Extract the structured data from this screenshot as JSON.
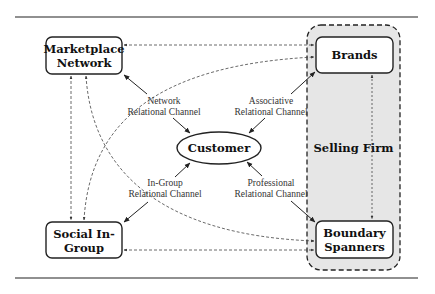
{
  "diagram": {
    "nodes": {
      "marketplace_network": {
        "line1": "Marketplace",
        "line2": "Network"
      },
      "social_in_group": {
        "line1": "Social In-",
        "line2": "Group"
      },
      "brands": {
        "label": "Brands"
      },
      "boundary_spanners": {
        "line1": "Boundary",
        "line2": "Spanners"
      },
      "customer": {
        "label": "Customer"
      }
    },
    "groups": {
      "selling_firm": {
        "label": "Selling Firm",
        "fill": "#e6e6e6"
      }
    },
    "edge_labels": {
      "network": {
        "line1": "Network",
        "line2": "Relational Channel"
      },
      "associative": {
        "line1": "Associative",
        "line2": "Relational Channel"
      },
      "in_group": {
        "line1": "In-Group",
        "line2": "Relational Channel"
      },
      "professional": {
        "line1": "Professional",
        "line2": "Relational Channel"
      }
    },
    "edges": [
      {
        "from": "Marketplace Network",
        "to": "Customer",
        "style": "solid",
        "label": "Network Relational Channel"
      },
      {
        "from": "Brands",
        "to": "Customer",
        "style": "solid",
        "label": "Associative Relational Channel"
      },
      {
        "from": "Social In-Group",
        "to": "Customer",
        "style": "solid",
        "label": "In-Group Relational Channel"
      },
      {
        "from": "Boundary Spanners",
        "to": "Customer",
        "style": "solid",
        "label": "Professional Relational Channel"
      },
      {
        "from": "Marketplace Network",
        "to": "Brands",
        "style": "dashed"
      },
      {
        "from": "Social In-Group",
        "to": "Brands",
        "style": "dashed-curve"
      },
      {
        "from": "Marketplace Network",
        "to": "Social In-Group",
        "style": "dashed"
      },
      {
        "from": "Marketplace Network",
        "to": "Boundary Spanners",
        "style": "dashed-curve"
      },
      {
        "from": "Social In-Group",
        "to": "Boundary Spanners",
        "style": "dashed"
      },
      {
        "from": "Brands",
        "to": "Boundary Spanners",
        "style": "dashed"
      }
    ]
  }
}
